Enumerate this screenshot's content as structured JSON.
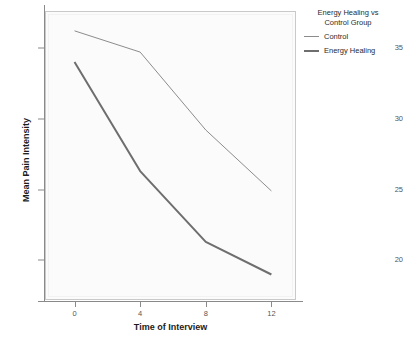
{
  "chart_data": {
    "type": "line",
    "title": "",
    "xlabel": "Time of Interview",
    "ylabel": "Mean Pain Intensity",
    "x": [
      0,
      4,
      8,
      12
    ],
    "xticklabels": [
      "0",
      "4",
      "8",
      "12"
    ],
    "yticklabels": [
      "20",
      "25",
      "30",
      "35"
    ],
    "yticks": [
      20,
      25,
      30,
      35
    ],
    "xlim": [
      -1.8,
      13.5
    ],
    "ylim": [
      17.2,
      37.6
    ],
    "grid": false,
    "legend_position": "right",
    "legend_title": "Energy Healing vs Control Group",
    "series": [
      {
        "name": "Control",
        "values": [
          36.2,
          34.7,
          29.2,
          24.9
        ],
        "color": "#8c8c8c",
        "width": 1.0
      },
      {
        "name": "Energy Healing",
        "values": [
          34.0,
          26.3,
          21.3,
          19.0
        ],
        "color": "#6e6e6e",
        "width": 2.0
      }
    ]
  },
  "legend": {
    "title_line_1": "Energy Healing vs",
    "title_line_2": "Control Group"
  },
  "colors": {
    "plot_background": "#fbfbfb",
    "plot_border": "#c9c9c9",
    "axis": "#8a8a8a",
    "tick_text": "#555555",
    "axis_title": "#1c1c1c"
  }
}
